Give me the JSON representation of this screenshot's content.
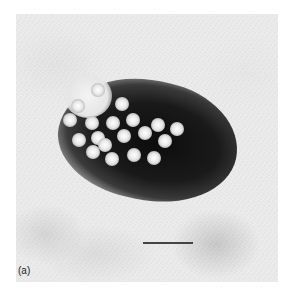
{
  "figure": {
    "panel_label": "(a)",
    "scale_bar": true
  },
  "virions": [
    {
      "x": 98,
      "y": 90
    },
    {
      "x": 78,
      "y": 106
    },
    {
      "x": 122,
      "y": 104
    },
    {
      "x": 70,
      "y": 120
    },
    {
      "x": 92,
      "y": 123
    },
    {
      "x": 113,
      "y": 123
    },
    {
      "x": 133,
      "y": 120
    },
    {
      "x": 158,
      "y": 125
    },
    {
      "x": 177,
      "y": 129
    },
    {
      "x": 79,
      "y": 140
    },
    {
      "x": 98,
      "y": 138
    },
    {
      "x": 124,
      "y": 136
    },
    {
      "x": 145,
      "y": 133
    },
    {
      "x": 165,
      "y": 141
    },
    {
      "x": 93,
      "y": 152
    },
    {
      "x": 112,
      "y": 159
    },
    {
      "x": 134,
      "y": 155
    },
    {
      "x": 154,
      "y": 158
    },
    {
      "x": 105,
      "y": 145
    }
  ]
}
